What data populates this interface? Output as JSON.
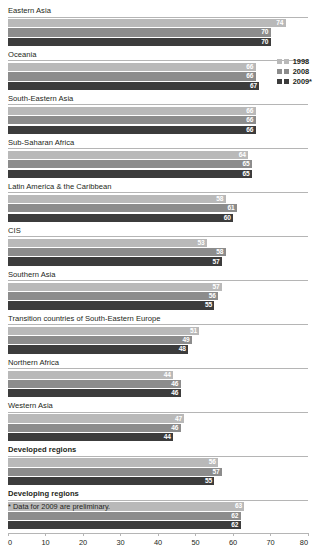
{
  "chart_data": {
    "type": "bar",
    "orientation": "horizontal",
    "title": "",
    "xlabel": "",
    "ylabel": "",
    "xlim": [
      0,
      80
    ],
    "xticks": [
      0,
      10,
      20,
      30,
      40,
      50,
      60,
      70,
      80
    ],
    "grid": false,
    "legend_position": "upper-right",
    "series": [
      {
        "name": "1998",
        "color": "#b9b9b9",
        "values": [
          74,
          66,
          66,
          64,
          58,
          53,
          57,
          51,
          44,
          47,
          56,
          63
        ]
      },
      {
        "name": "2008",
        "color": "#8c8c8c",
        "values": [
          70,
          66,
          66,
          65,
          61,
          58,
          56,
          49,
          46,
          46,
          57,
          62
        ]
      },
      {
        "name": "2009*",
        "color": "#3c3c3c",
        "values": [
          70,
          67,
          66,
          65,
          60,
          57,
          55,
          48,
          46,
          44,
          55,
          62
        ]
      }
    ],
    "categories": [
      "Eastern Asia",
      "Oceania",
      "South-Eastern Asia",
      "Sub-Saharan Africa",
      "Latin America & the Caribbean",
      "CIS",
      "Southern Asia",
      "Transition countries of South-Eastern Europe",
      "Northern Africa",
      "Western Asia",
      "Developed regions",
      "Developing regions"
    ],
    "emphasized_categories": [
      "Developed regions",
      "Developing regions"
    ],
    "footnote": "* Data for 2009 are preliminary."
  }
}
